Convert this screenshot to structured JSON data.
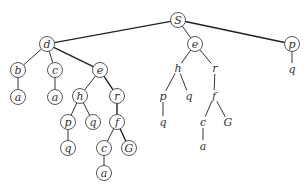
{
  "diagram": {
    "type": "tree-comparison",
    "nodes": [
      {
        "id": "S",
        "label": "S",
        "x": 178,
        "y": 20,
        "circled": true
      },
      {
        "id": "d",
        "label": "d",
        "x": 47,
        "y": 44,
        "circled": true
      },
      {
        "id": "e1",
        "label": "e",
        "x": 195,
        "y": 44,
        "circled": true
      },
      {
        "id": "p1",
        "label": "p",
        "x": 292,
        "y": 44,
        "circled": true
      },
      {
        "id": "b",
        "label": "b",
        "x": 18,
        "y": 70,
        "circled": true
      },
      {
        "id": "c1",
        "label": "c",
        "x": 55,
        "y": 70,
        "circled": true
      },
      {
        "id": "e2",
        "label": "e",
        "x": 100,
        "y": 70,
        "circled": true
      },
      {
        "id": "a1",
        "label": "a",
        "x": 18,
        "y": 97,
        "circled": true
      },
      {
        "id": "a2",
        "label": "a",
        "x": 55,
        "y": 97,
        "circled": true
      },
      {
        "id": "h1",
        "label": "h",
        "x": 80,
        "y": 96,
        "circled": true
      },
      {
        "id": "r1",
        "label": "r",
        "x": 117,
        "y": 96,
        "circled": true
      },
      {
        "id": "p2",
        "label": "p",
        "x": 68,
        "y": 122,
        "circled": true
      },
      {
        "id": "q1",
        "label": "q",
        "x": 93,
        "y": 122,
        "circled": true
      },
      {
        "id": "f1",
        "label": "f",
        "x": 117,
        "y": 122,
        "circled": true
      },
      {
        "id": "q2",
        "label": "q",
        "x": 68,
        "y": 148,
        "circled": true
      },
      {
        "id": "c2",
        "label": "c",
        "x": 104,
        "y": 148,
        "circled": true
      },
      {
        "id": "G1",
        "label": "G",
        "x": 129,
        "y": 148,
        "circled": true
      },
      {
        "id": "a3",
        "label": "a",
        "x": 104,
        "y": 173,
        "circled": true
      },
      {
        "id": "h2",
        "label": "h",
        "x": 178,
        "y": 68,
        "circled": false
      },
      {
        "id": "r2",
        "label": "r",
        "x": 215,
        "y": 68,
        "circled": false
      },
      {
        "id": "p3",
        "label": "p",
        "x": 163,
        "y": 96,
        "circled": false
      },
      {
        "id": "q3",
        "label": "q",
        "x": 189,
        "y": 96,
        "circled": false
      },
      {
        "id": "f2",
        "label": "f",
        "x": 214,
        "y": 96,
        "circled": false
      },
      {
        "id": "q4",
        "label": "q",
        "x": 163,
        "y": 122,
        "circled": false
      },
      {
        "id": "c3",
        "label": "c",
        "x": 203,
        "y": 122,
        "circled": false
      },
      {
        "id": "G2",
        "label": "G",
        "x": 228,
        "y": 122,
        "circled": false
      },
      {
        "id": "a4",
        "label": "a",
        "x": 203,
        "y": 146,
        "circled": false
      },
      {
        "id": "q5",
        "label": "q",
        "x": 292,
        "y": 69,
        "circled": false
      }
    ],
    "edges": [
      {
        "from": "S",
        "to": "d",
        "bold": true
      },
      {
        "from": "S",
        "to": "e1",
        "bold": false
      },
      {
        "from": "S",
        "to": "p1",
        "bold": true
      },
      {
        "from": "d",
        "to": "b",
        "bold": false
      },
      {
        "from": "d",
        "to": "c1",
        "bold": false
      },
      {
        "from": "d",
        "to": "e2",
        "bold": true
      },
      {
        "from": "b",
        "to": "a1",
        "bold": false
      },
      {
        "from": "c1",
        "to": "a2",
        "bold": false
      },
      {
        "from": "e2",
        "to": "h1",
        "bold": false
      },
      {
        "from": "e2",
        "to": "r1",
        "bold": true
      },
      {
        "from": "h1",
        "to": "p2",
        "bold": false
      },
      {
        "from": "h1",
        "to": "q1",
        "bold": false
      },
      {
        "from": "r1",
        "to": "f1",
        "bold": true
      },
      {
        "from": "p2",
        "to": "q2",
        "bold": false
      },
      {
        "from": "f1",
        "to": "c2",
        "bold": false
      },
      {
        "from": "f1",
        "to": "G1",
        "bold": true
      },
      {
        "from": "c2",
        "to": "a3",
        "bold": false
      },
      {
        "from": "e1",
        "to": "h2",
        "bold": false
      },
      {
        "from": "e1",
        "to": "r2",
        "bold": false
      },
      {
        "from": "h2",
        "to": "p3",
        "bold": false
      },
      {
        "from": "h2",
        "to": "q3",
        "bold": false
      },
      {
        "from": "r2",
        "to": "f2",
        "bold": false
      },
      {
        "from": "p3",
        "to": "q4",
        "bold": false
      },
      {
        "from": "f2",
        "to": "c3",
        "bold": false
      },
      {
        "from": "f2",
        "to": "G2",
        "bold": false
      },
      {
        "from": "c3",
        "to": "a4",
        "bold": false
      },
      {
        "from": "p1",
        "to": "q5",
        "bold": false
      }
    ]
  }
}
